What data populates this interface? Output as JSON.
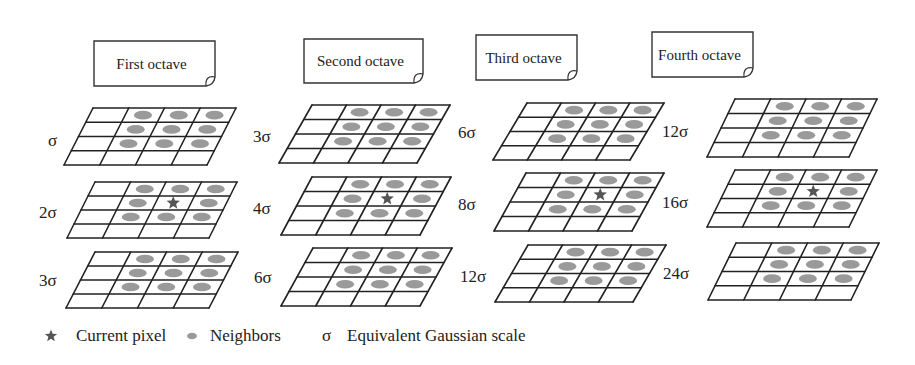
{
  "colors": {
    "grid_line": "#222222",
    "neighbor": "#9a9a9a",
    "current_pixel": "#555555",
    "note_border": "#333333"
  },
  "octaves": [
    {
      "label": "First octave",
      "note": {
        "x": 94,
        "y": 41,
        "w": 121,
        "h": 45
      },
      "layers": [
        {
          "scale": "σ",
          "role": "below",
          "grid": {
            "tlx": 93,
            "ty": 108,
            "trx": 236,
            "blx": 64,
            "by": 165
          },
          "label_pos": {
            "x": 48,
            "y": 146
          }
        },
        {
          "scale": "2σ",
          "role": "current",
          "grid": {
            "tlx": 95,
            "ty": 182,
            "trx": 237,
            "blx": 67,
            "by": 238
          },
          "label_pos": {
            "x": 39,
            "y": 218
          }
        },
        {
          "scale": "3σ",
          "role": "above",
          "grid": {
            "tlx": 95,
            "ty": 252,
            "trx": 238,
            "blx": 66,
            "by": 308
          },
          "label_pos": {
            "x": 39,
            "y": 286
          }
        }
      ]
    },
    {
      "label": "Second octave",
      "note": {
        "x": 304,
        "y": 39,
        "w": 119,
        "h": 44
      },
      "layers": [
        {
          "scale": "3σ",
          "role": "below",
          "grid": {
            "tlx": 312,
            "ty": 105,
            "trx": 450,
            "blx": 279,
            "by": 163
          },
          "label_pos": {
            "x": 253,
            "y": 142
          }
        },
        {
          "scale": "4σ",
          "role": "current",
          "grid": {
            "tlx": 312,
            "ty": 177,
            "trx": 451,
            "blx": 281,
            "by": 235
          },
          "label_pos": {
            "x": 253,
            "y": 214
          }
        },
        {
          "scale": "6σ",
          "role": "above",
          "grid": {
            "tlx": 313,
            "ty": 248,
            "trx": 452,
            "blx": 281,
            "by": 306
          },
          "label_pos": {
            "x": 254,
            "y": 283
          }
        }
      ]
    },
    {
      "label": "Third octave",
      "note": {
        "x": 476,
        "y": 35,
        "w": 101,
        "h": 45
      },
      "layers": [
        {
          "scale": "6σ",
          "role": "below",
          "grid": {
            "tlx": 527,
            "ty": 103,
            "trx": 664,
            "blx": 493,
            "by": 160
          },
          "label_pos": {
            "x": 458,
            "y": 138
          }
        },
        {
          "scale": "8σ",
          "role": "current",
          "grid": {
            "tlx": 526,
            "ty": 173,
            "trx": 664,
            "blx": 494,
            "by": 231
          },
          "label_pos": {
            "x": 458,
            "y": 210
          }
        },
        {
          "scale": "12σ",
          "role": "above",
          "grid": {
            "tlx": 528,
            "ty": 245,
            "trx": 666,
            "blx": 495,
            "by": 302
          },
          "label_pos": {
            "x": 460,
            "y": 282
          }
        }
      ]
    },
    {
      "label": "Fourth octave",
      "note": {
        "x": 652,
        "y": 32,
        "w": 101,
        "h": 45
      },
      "layers": [
        {
          "scale": "12σ",
          "role": "below",
          "grid": {
            "tlx": 735,
            "ty": 99,
            "trx": 877,
            "blx": 707,
            "by": 157
          },
          "label_pos": {
            "x": 662,
            "y": 137
          }
        },
        {
          "scale": "16σ",
          "role": "current",
          "grid": {
            "tlx": 735,
            "ty": 170,
            "trx": 877,
            "blx": 707,
            "by": 227
          },
          "label_pos": {
            "x": 662,
            "y": 208
          }
        },
        {
          "scale": "24σ",
          "role": "above",
          "grid": {
            "tlx": 736,
            "ty": 243,
            "trx": 879,
            "blx": 708,
            "by": 300
          },
          "label_pos": {
            "x": 663,
            "y": 279
          }
        }
      ]
    }
  ],
  "grid_spec": {
    "rows": 4,
    "cols": 4,
    "neighbor_cells": [
      [
        0,
        1
      ],
      [
        0,
        2
      ],
      [
        0,
        3
      ],
      [
        1,
        1
      ],
      [
        1,
        2
      ],
      [
        1,
        3
      ],
      [
        2,
        1
      ],
      [
        2,
        2
      ],
      [
        2,
        3
      ]
    ],
    "current_cell": [
      1,
      2
    ]
  },
  "legend": {
    "items": [
      {
        "symbol": "star",
        "label": "Current pixel",
        "sx": 51,
        "tx": 76
      },
      {
        "symbol": "ellipse",
        "label": "Neighbors",
        "sx": 192,
        "tx": 210
      },
      {
        "symbol": "σ",
        "label": "Equivalent Gaussian scale",
        "sx": 328,
        "tx": 347
      }
    ],
    "y": 341
  }
}
